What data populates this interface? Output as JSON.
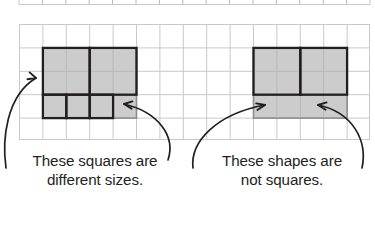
{
  "figure": {
    "type": "grid-geometry-illustration",
    "background": "#ffffff",
    "grid": {
      "name": "square-grid",
      "x": 19,
      "y": 24,
      "cols": 15,
      "rows": 5,
      "cell": 23.4,
      "line_color": "#c9c9cb",
      "line_width": 1
    },
    "top_partial_grid": {
      "name": "partial-grid-above",
      "y_bottom": 4,
      "cols": 15,
      "tick_height": 5,
      "line_color": "#c9c9cb"
    },
    "colors": {
      "fill": "#cccccc",
      "fill_border_light": "#8c8c8c",
      "stroke_dark": "#231f20",
      "grid_line": "#c9c9cb",
      "text": "#231f20"
    }
  },
  "left_figure": {
    "name": "left-shape-group",
    "shaded_region": {
      "col": 1,
      "row": 1,
      "w": 4,
      "h": 3
    },
    "outlined_squares": [
      {
        "label": "large-square-1",
        "col": 1,
        "row": 1,
        "size": 2
      },
      {
        "label": "large-square-2",
        "col": 3,
        "row": 1,
        "size": 2
      },
      {
        "label": "small-square-1",
        "col": 1,
        "row": 3,
        "size": 1
      },
      {
        "label": "small-square-2",
        "col": 2,
        "row": 3,
        "size": 1
      },
      {
        "label": "small-square-3",
        "col": 3,
        "row": 3,
        "size": 1
      }
    ],
    "arrows": [
      {
        "name": "callout-arrow-left-upper",
        "points_to": "large-square-1"
      },
      {
        "name": "callout-arrow-left-lower",
        "points_to": "small-square-3"
      }
    ],
    "caption_line1": "These squares are",
    "caption_line2": "different sizes."
  },
  "right_figure": {
    "name": "right-shape-group",
    "shaded_region": {
      "col": 10,
      "row": 1,
      "w": 4,
      "h": 3
    },
    "outlined_rectangles": [
      {
        "label": "rectangle-1",
        "col": 10,
        "row": 1,
        "w": 2,
        "h": 2
      },
      {
        "label": "rectangle-2",
        "col": 12,
        "row": 1,
        "w": 2,
        "h": 2
      }
    ],
    "arrows": [
      {
        "name": "callout-arrow-right-left",
        "points_to": "rectangle-1-bottom"
      },
      {
        "name": "callout-arrow-right-right",
        "points_to": "rectangle-2-bottom"
      }
    ],
    "caption_line1": "These shapes are",
    "caption_line2": "not squares."
  }
}
